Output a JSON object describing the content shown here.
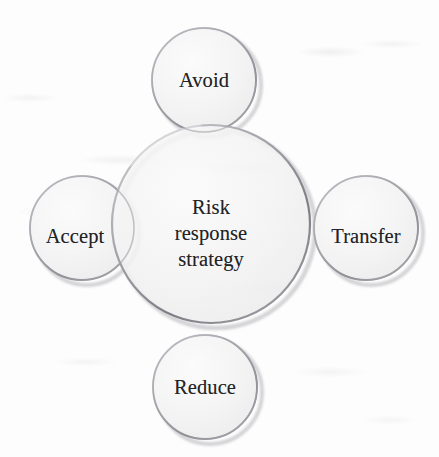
{
  "diagram": {
    "type": "venn-cluster",
    "title_text_in_center": "Risk\nresponse\nstrategy",
    "background_color": "#fdfdfd",
    "circle_fill_color": "#f2f2f2",
    "circle_stroke_color": "#8d8d92",
    "text_color": "#232326",
    "center": {
      "name": "risk-response-strategy",
      "label": "Risk\nresponse\nstrategy",
      "label_lines": [
        "Risk",
        "response",
        "strategy"
      ],
      "cx": 211,
      "cy": 224,
      "r": 99
    },
    "satellites": [
      {
        "name": "avoid",
        "label": "Avoid",
        "position": "top",
        "cx": 204,
        "cy": 80,
        "r": 52,
        "label_x": 204,
        "label_y": 80
      },
      {
        "name": "accept",
        "label": "Accept",
        "position": "left",
        "cx": 82,
        "cy": 228,
        "r": 52,
        "label_x": 75,
        "label_y": 236
      },
      {
        "name": "transfer",
        "label": "Transfer",
        "position": "right",
        "cx": 366,
        "cy": 228,
        "r": 52,
        "label_x": 366,
        "label_y": 236
      },
      {
        "name": "reduce",
        "label": "Reduce",
        "position": "bottom",
        "cx": 205,
        "cy": 387,
        "r": 52,
        "label_x": 205,
        "label_y": 387
      }
    ]
  }
}
